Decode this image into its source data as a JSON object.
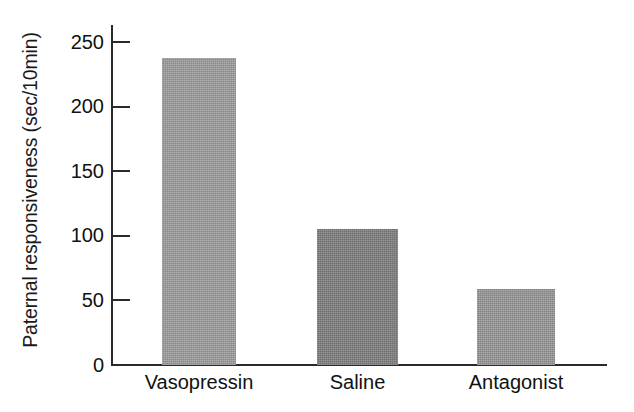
{
  "chart_data": {
    "type": "bar",
    "title": "",
    "subtitle": "",
    "xlabel": "",
    "ylabel": "Paternal responsiveness (sec/10min)",
    "categories": [
      "Vasopressin",
      "Saline",
      "Antagonist"
    ],
    "values": [
      238,
      105,
      59
    ],
    "series": [
      {
        "name": "Paternal responsiveness",
        "values": [
          238,
          105,
          59
        ]
      }
    ],
    "ylim": [
      0,
      262
    ],
    "yticks": [
      0,
      50,
      100,
      150,
      200,
      250
    ],
    "ytick_labels": [
      "0",
      "50",
      "100",
      "150",
      "200",
      "250"
    ],
    "grid": false,
    "legend": false,
    "legend_position": "none",
    "bar_colors": [
      "#9a9a9a",
      "#7c7c7c",
      "#949494"
    ],
    "axis_color": "#2a2a2a",
    "text_color": "#111111",
    "background": "#ffffff",
    "annotations": []
  },
  "axis": {
    "y_title": "Paternal responsiveness (sec/10min)",
    "ticks": [
      {
        "label": "250",
        "value": 250
      },
      {
        "label": "200",
        "value": 200
      },
      {
        "label": "150",
        "value": 150
      },
      {
        "label": "100",
        "value": 100
      },
      {
        "label": "50",
        "value": 50
      },
      {
        "label": "0",
        "value": 0
      }
    ]
  },
  "bars": [
    {
      "label": "Vasopressin",
      "value": 238,
      "color": "#9a9a9a"
    },
    {
      "label": "Saline",
      "value": 105,
      "color": "#7c7c7c"
    },
    {
      "label": "Antagonist",
      "value": 59,
      "color": "#949494"
    }
  ]
}
